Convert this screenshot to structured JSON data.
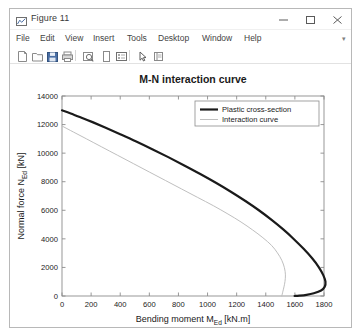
{
  "window": {
    "title": "Figure 11",
    "icon": "matlab-figure-icon",
    "controls": {
      "minimize": "minimize-icon",
      "maximize": "maximize-icon",
      "close": "close-icon"
    }
  },
  "menubar": {
    "items": [
      {
        "label": "File",
        "x": 6
      },
      {
        "label": "Edit",
        "x": 30
      },
      {
        "label": "View",
        "x": 55
      },
      {
        "label": "Insert",
        "x": 83
      },
      {
        "label": "Tools",
        "x": 117
      },
      {
        "label": "Desktop",
        "x": 148
      },
      {
        "label": "Window",
        "x": 192
      },
      {
        "label": "Help",
        "x": 234
      }
    ],
    "overflow": "▾"
  },
  "toolbar": {
    "items": [
      {
        "name": "new-figure-icon",
        "x": 6
      },
      {
        "name": "open-file-icon",
        "x": 21
      },
      {
        "name": "save-figure-icon",
        "x": 36
      },
      {
        "name": "print-figure-icon",
        "x": 51
      },
      {
        "name": "zoom-link-icon",
        "x": 72
      },
      {
        "name": "insert-colorbar-icon",
        "x": 90
      },
      {
        "name": "insert-legend-icon",
        "x": 105
      },
      {
        "name": "pointer-tool-icon",
        "x": 126
      },
      {
        "name": "data-cursor-icon",
        "x": 142
      }
    ],
    "separators": [
      65,
      119
    ]
  },
  "chart_data": {
    "type": "line",
    "title": "M-N interaction curve",
    "xlabel": "Bending moment M_Ed [kN.m]",
    "xlabel_main": "Bending moment M",
    "xlabel_sub": "Ed",
    "xlabel_unit": " [kN.m]",
    "ylabel": "Normal force N_Ed [kN]",
    "ylabel_main": "Normal force N",
    "ylabel_sub": "Ed",
    "ylabel_unit": " [kN]",
    "xlim": [
      0,
      1800
    ],
    "ylim": [
      0,
      14000
    ],
    "xticks": [
      0,
      200,
      400,
      600,
      800,
      1000,
      1200,
      1400,
      1600,
      1800
    ],
    "yticks": [
      0,
      2000,
      4000,
      6000,
      8000,
      10000,
      12000,
      14000
    ],
    "grid": false,
    "legend_position": "top-right",
    "series": [
      {
        "name": "Plastic cross-section",
        "color": "#1a1a1a",
        "width": 2.2,
        "points": [
          [
            0,
            13000
          ],
          [
            60,
            12780
          ],
          [
            130,
            12500
          ],
          [
            210,
            12170
          ],
          [
            300,
            11780
          ],
          [
            400,
            11330
          ],
          [
            510,
            10820
          ],
          [
            620,
            10280
          ],
          [
            730,
            9720
          ],
          [
            840,
            9140
          ],
          [
            950,
            8540
          ],
          [
            1060,
            7910
          ],
          [
            1160,
            7300
          ],
          [
            1260,
            6650
          ],
          [
            1350,
            6020
          ],
          [
            1440,
            5330
          ],
          [
            1520,
            4660
          ],
          [
            1590,
            4010
          ],
          [
            1660,
            3300
          ],
          [
            1720,
            2620
          ],
          [
            1765,
            2010
          ],
          [
            1795,
            1460
          ],
          [
            1810,
            1000
          ],
          [
            1805,
            640
          ],
          [
            1780,
            380
          ],
          [
            1730,
            190
          ],
          [
            1680,
            80
          ],
          [
            1630,
            20
          ],
          [
            1598,
            0
          ]
        ]
      },
      {
        "name": "Interaction curve",
        "color": "#bfbfbf",
        "width": 1.0,
        "points": [
          [
            0,
            11900
          ],
          [
            80,
            11470
          ],
          [
            170,
            10990
          ],
          [
            270,
            10450
          ],
          [
            380,
            9860
          ],
          [
            490,
            9270
          ],
          [
            600,
            8680
          ],
          [
            710,
            8090
          ],
          [
            820,
            7500
          ],
          [
            930,
            6910
          ],
          [
            1040,
            6320
          ],
          [
            1140,
            5740
          ],
          [
            1230,
            5180
          ],
          [
            1310,
            4620
          ],
          [
            1380,
            4080
          ],
          [
            1440,
            3540
          ],
          [
            1480,
            3020
          ],
          [
            1510,
            2500
          ],
          [
            1528,
            1980
          ],
          [
            1535,
            1480
          ],
          [
            1532,
            1020
          ],
          [
            1525,
            640
          ],
          [
            1518,
            340
          ],
          [
            1513,
            130
          ],
          [
            1510,
            0
          ]
        ]
      }
    ]
  }
}
